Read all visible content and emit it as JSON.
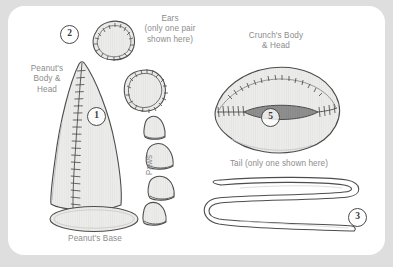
{
  "diagram": {
    "background_color": "#dedede",
    "card_color": "#ffffff",
    "ink_color": "#4a4a4a",
    "label_color": "#8c8c8c",
    "piece_fill": "#e8e8e6",
    "mouth_fill": "#9a9a9a"
  },
  "labels": {
    "peanut_body_head": "Peanut's\nBody &\nHead",
    "ears": "Ears\n(only one pair\nshown here)",
    "crunch_body_head": "Crunch's Body\n& Head",
    "paws": "Paws",
    "tail": "Tail (only one shown here)",
    "peanut_base": "Peanut's Base"
  },
  "callouts": [
    {
      "number": "1",
      "refers_to": "Peanut's Body & Head"
    },
    {
      "number": "2",
      "refers_to": "Ears"
    },
    {
      "number": "3",
      "refers_to": "Tail"
    },
    {
      "number": "5",
      "refers_to": "Crunch's Body & Head"
    }
  ],
  "pieces": {
    "peanut_body_head_count": 1,
    "ears_shown": 2,
    "paws_shown": 4,
    "peanut_base_count": 1,
    "crunch_body_head_count": 1,
    "tail_shown": 1
  }
}
